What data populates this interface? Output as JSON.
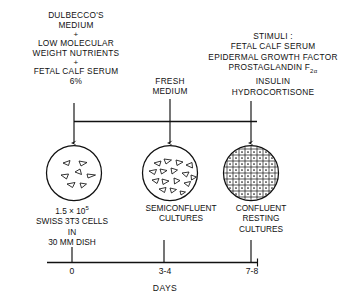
{
  "figure": {
    "type": "experimental-timeline-diagram",
    "axis_title": "DAYS"
  },
  "media": {
    "left": {
      "lines": [
        "DULBECCO'S",
        "MEDIUM",
        "+",
        "LOW MOLECULAR",
        "WEIGHT NUTRIENTS",
        "+",
        "FETAL CALF SERUM",
        "6%"
      ]
    },
    "middle": {
      "lines": [
        "FRESH",
        "MEDIUM"
      ]
    },
    "right": {
      "heading": "STIMULI :",
      "items": [
        "FETAL CALF SERUM",
        "EPIDERMAL GROWTH FACTOR"
      ],
      "prostaglandin": {
        "name": "PROSTAGLANDIN",
        "symbol": "F",
        "subscript": "2α"
      },
      "items_after": [
        "INSULIN",
        "HYDROCORTISONE"
      ]
    }
  },
  "stages": [
    {
      "id": "stage-1",
      "pattern": "sparse-cells",
      "caption": [
        "1.5 × 10",
        "SWISS 3T3 CELLS",
        "IN",
        "30 MM DISH"
      ],
      "caption_exponent": "5",
      "cell_count": 6,
      "tick": "0"
    },
    {
      "id": "stage-2",
      "pattern": "semiconfluent-cells",
      "caption": [
        "SEMICONFLUENT",
        "CULTURES"
      ],
      "cell_count": 15,
      "tick": "3-4"
    },
    {
      "id": "stage-3",
      "pattern": "confluent-grid",
      "caption": [
        "CONFLUENT",
        "RESTING",
        "CULTURES"
      ],
      "tick": "7-8"
    }
  ],
  "colors": {
    "ink": "#111111",
    "background": "#ffffff"
  }
}
